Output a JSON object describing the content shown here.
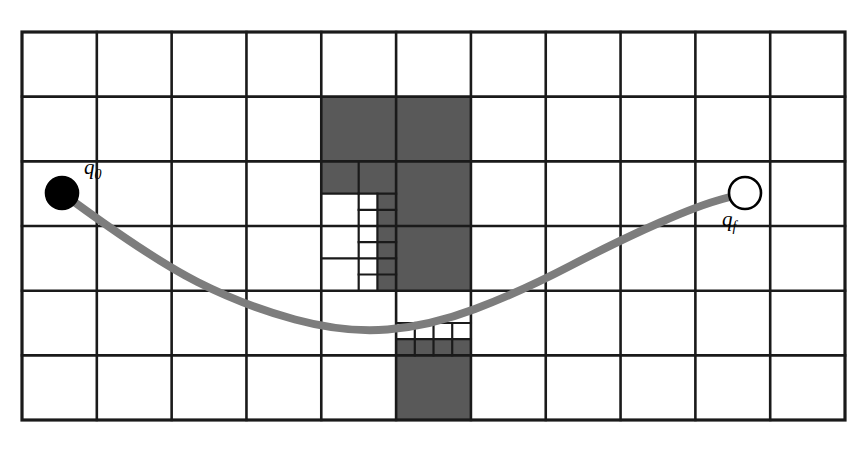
{
  "figure": {
    "type": "quadtree-path-planning-diagram",
    "title": "",
    "background_color": "#ffffff",
    "canvas": {
      "width": 865,
      "height": 452
    }
  },
  "grid": {
    "name": "coarse-grid",
    "origin_x": 22,
    "origin_y": 32,
    "width": 823,
    "height": 388,
    "columns": 11,
    "rows": 6,
    "cell_width": 74.82,
    "cell_height": 64.67,
    "line_color": "#1a1a1a",
    "line_width": 2.6,
    "outer_line_width": 3.2,
    "free_fill": "#ffffff"
  },
  "colors": {
    "obstacle_fill": "#595959",
    "path_stroke": "#7d7d7d",
    "node_border": "#000000",
    "start_fill": "#000000",
    "goal_fill": "#ffffff",
    "label_color": "#000000"
  },
  "obstacle_cells": [
    {
      "name": "cell-c5-r2",
      "col": 4,
      "row": 1,
      "level": 0
    },
    {
      "name": "cell-c6-r2",
      "col": 5,
      "row": 1,
      "level": 0
    },
    {
      "name": "cell-c6-r3",
      "col": 5,
      "row": 2,
      "level": 0
    },
    {
      "name": "cell-c6-r4-upper",
      "col": 5,
      "row": 3,
      "level": 0
    },
    {
      "name": "cell-c6-r6",
      "col": 5,
      "row": 5,
      "level": 0
    }
  ],
  "subdivided_regions": [
    {
      "name": "quad-region-c5-r3",
      "col": 4,
      "row": 2,
      "description": "column 5 row 3 subdivided recursively toward the obstacle corner",
      "filled_quadrants": [
        "top-left",
        "top-right"
      ],
      "recursion_depth": 4
    },
    {
      "name": "quad-region-c5-r4",
      "col": 4,
      "row": 3,
      "description": "column 5 row 4 subdivided, right strip filled",
      "filled_quadrants": [
        "right-strip"
      ],
      "recursion_depth": 4
    },
    {
      "name": "quad-region-c6-r5",
      "col": 5,
      "row": 4,
      "description": "column 6 row 5 subdivided, lower band filled",
      "filled_quadrants": [
        "bottom-row"
      ],
      "recursion_depth": 3
    }
  ],
  "path": {
    "name": "planned-path",
    "stroke": "#7d7d7d",
    "stroke_width": 8,
    "start": {
      "x": 62,
      "y": 193
    },
    "end": {
      "x": 745,
      "y": 193
    },
    "waypoints": [
      {
        "x": 62,
        "y": 193
      },
      {
        "x": 150,
        "y": 258
      },
      {
        "x": 245,
        "y": 306
      },
      {
        "x": 345,
        "y": 333
      },
      {
        "x": 430,
        "y": 326
      },
      {
        "x": 520,
        "y": 292
      },
      {
        "x": 620,
        "y": 240
      },
      {
        "x": 700,
        "y": 205
      },
      {
        "x": 745,
        "y": 193
      }
    ]
  },
  "nodes": [
    {
      "name": "start-node",
      "label": "q",
      "subscript": "0",
      "label_full": "q0",
      "cx": 62,
      "cy": 193,
      "r": 16,
      "fill": "#000000",
      "stroke": "#000000",
      "label_x": 84,
      "label_y": 174
    },
    {
      "name": "goal-node",
      "label": "q",
      "subscript": "f",
      "label_full": "qf",
      "cx": 745,
      "cy": 193,
      "r": 16,
      "fill": "#ffffff",
      "stroke": "#000000",
      "label_x": 722,
      "label_y": 226
    }
  ]
}
